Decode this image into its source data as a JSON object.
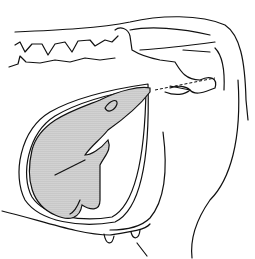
{
  "figure": {
    "colors": {
      "line": "#111111",
      "background": "#ffffff",
      "fill_pattern": "#9a9a9a"
    }
  }
}
